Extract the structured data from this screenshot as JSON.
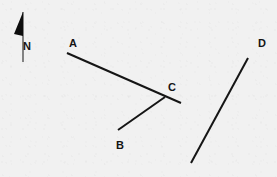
{
  "diagram": {
    "type": "survey-line-diagram",
    "background_color": "#f1f1f1",
    "ink_color": "#151515",
    "width": 277,
    "height": 177,
    "compass": {
      "label": "N",
      "label_x": 27,
      "label_y": 47,
      "staff_top_x": 23,
      "staff_top_y": 12,
      "staff_bottom_x": 23,
      "staff_bottom_y": 62,
      "flag_points": "23,12 23,36 14,34",
      "flag_color": "#0d0d0d",
      "staff_color": "#3a3a3a"
    },
    "lines": [
      {
        "id": "line-ac",
        "name": "line-a-to-c",
        "x1": 67,
        "y1": 53,
        "x2": 181,
        "y2": 103,
        "stroke": "#151515",
        "width": 2
      },
      {
        "id": "line-bc",
        "name": "line-b-to-c",
        "x1": 118,
        "y1": 130,
        "x2": 165,
        "y2": 97,
        "stroke": "#151515",
        "width": 2
      },
      {
        "id": "line-d",
        "name": "line-d",
        "x1": 248,
        "y1": 58,
        "x2": 191,
        "y2": 163,
        "stroke": "#151515",
        "width": 2
      }
    ],
    "labels": [
      {
        "id": "label-a",
        "name": "point-label-a",
        "text": "A",
        "x": 73,
        "y": 44
      },
      {
        "id": "label-b",
        "name": "point-label-b",
        "text": "B",
        "x": 120,
        "y": 146
      },
      {
        "id": "label-c",
        "name": "point-label-c",
        "text": "C",
        "x": 172,
        "y": 88
      },
      {
        "id": "label-d",
        "name": "point-label-d",
        "text": "D",
        "x": 262,
        "y": 44
      }
    ]
  }
}
